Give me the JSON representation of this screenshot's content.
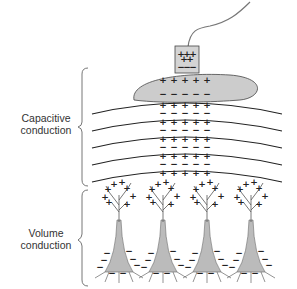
{
  "labels": {
    "capacitive": [
      "Capacitive",
      "conduction"
    ],
    "volume": [
      "Volume",
      "conduction"
    ]
  },
  "electrode": {
    "top_charges": "+ + + + +",
    "bottom_charges": "- - -"
  },
  "skin": {
    "top_charges": "+ + + + +",
    "bottom_charges": "- - - - -"
  },
  "layers": {
    "count": 5,
    "charges_per_row": 5,
    "positive_symbol": "+",
    "negative_symbol": "−"
  },
  "neurons": {
    "count": 4,
    "positive_symbol": "+",
    "negative_symbol": "−"
  },
  "colors": {
    "fill_gray": "#c8c8c8",
    "line": "#222222",
    "stroke_gray": "#777777"
  }
}
